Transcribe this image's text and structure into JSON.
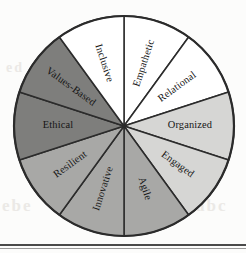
{
  "figure": {
    "center": {
      "x": 124,
      "y": 126
    },
    "radius": 110,
    "outline_color": "#2b2b2b",
    "background_color": "#fcfcfb"
  },
  "chart_data": {
    "type": "pie",
    "title": "",
    "xlabel": "",
    "ylabel": "",
    "legend": "none",
    "grid": false,
    "equal_slices": true,
    "slice_count": 10,
    "slice_degrees": 36,
    "start_angle_deg": 0,
    "categories": [
      "Empathetic",
      "Relational",
      "Organized",
      "Engaged",
      "Agile",
      "Innovative",
      "Resilient",
      "Ethical",
      "Values-Based",
      "Inclusive"
    ],
    "values": [
      10,
      10,
      10,
      10,
      10,
      10,
      10,
      10,
      10,
      10
    ],
    "colors": [
      "#ffffff",
      "#ffffff",
      "#d6d6d4",
      "#d6d6d4",
      "#a8a8a6",
      "#a8a8a6",
      "#a8a8a6",
      "#7e7e7c",
      "#7e7e7c",
      "#ffffff"
    ],
    "segments": [
      {
        "label": "Empathetic",
        "start_deg": 0,
        "end_deg": 36,
        "color": "#ffffff",
        "text_rotation_deg": 72,
        "flipped": false
      },
      {
        "label": "Relational",
        "start_deg": 36,
        "end_deg": 72,
        "color": "#ffffff",
        "text_rotation_deg": 36,
        "flipped": false
      },
      {
        "label": "Organized",
        "start_deg": 72,
        "end_deg": 108,
        "color": "#d6d6d4",
        "text_rotation_deg": 0,
        "flipped": false
      },
      {
        "label": "Engaged",
        "start_deg": 108,
        "end_deg": 144,
        "color": "#d6d6d4",
        "text_rotation_deg": -36,
        "flipped": false
      },
      {
        "label": "Agile",
        "start_deg": 144,
        "end_deg": 180,
        "color": "#a8a8a6",
        "text_rotation_deg": -72,
        "flipped": false
      },
      {
        "label": "Innovative",
        "start_deg": 180,
        "end_deg": 216,
        "color": "#a8a8a6",
        "text_rotation_deg": 72,
        "flipped": true
      },
      {
        "label": "Resilient",
        "start_deg": 216,
        "end_deg": 252,
        "color": "#a8a8a6",
        "text_rotation_deg": 36,
        "flipped": true
      },
      {
        "label": "Ethical",
        "start_deg": 252,
        "end_deg": 288,
        "color": "#7e7e7c",
        "text_rotation_deg": 0,
        "flipped": true
      },
      {
        "label": "Values-Based",
        "start_deg": 288,
        "end_deg": 324,
        "color": "#7e7e7c",
        "text_rotation_deg": -36,
        "flipped": true
      },
      {
        "label": "Inclusive",
        "start_deg": 324,
        "end_deg": 360,
        "color": "#ffffff",
        "text_rotation_deg": -72,
        "flipped": true
      }
    ]
  },
  "artifacts": {
    "ghost_text_left": "ebe",
    "ghost_text_right": "abc",
    "ghost_text_upper_right": "nm",
    "ghost_text_upper_left": "ed"
  }
}
